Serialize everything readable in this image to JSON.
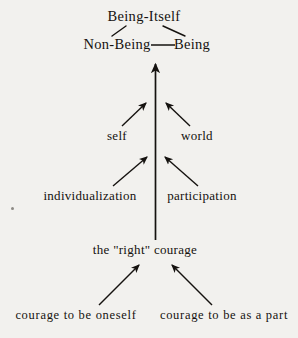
{
  "diagram": {
    "background_color": "#f2f1ee",
    "ink_color": "#15120f",
    "nodes": {
      "being_itself": "Being-Itself",
      "non_being": "Non-Being",
      "being": "Being",
      "self": "self",
      "world": "world",
      "individualization": "individualization",
      "participation": "participation",
      "right_courage": "the \"right\" courage",
      "courage_to_be_oneself": "courage to be oneself",
      "courage_to_be_as_a_part": "courage to be as a part"
    },
    "connections": [
      {
        "from": "being_itself",
        "to": "non_being",
        "style": "plain-line"
      },
      {
        "from": "being_itself",
        "to": "being",
        "style": "plain-line"
      },
      {
        "from": "non_being",
        "to": "being",
        "style": "horizontal-line"
      },
      {
        "from": "right_courage",
        "to": "being_itself",
        "style": "vertical-arrow-up"
      },
      {
        "from": "self",
        "to": "axis",
        "style": "diagonal-arrow-up-right"
      },
      {
        "from": "world",
        "to": "axis",
        "style": "diagonal-arrow-up-left"
      },
      {
        "from": "individualization",
        "to": "axis",
        "style": "diagonal-arrow-up-right"
      },
      {
        "from": "participation",
        "to": "axis",
        "style": "diagonal-arrow-up-left"
      },
      {
        "from": "courage_to_be_oneself",
        "to": "right_courage",
        "style": "diagonal-arrow-up-right"
      },
      {
        "from": "courage_to_be_as_a_part",
        "to": "right_courage",
        "style": "diagonal-arrow-up-left"
      }
    ]
  }
}
